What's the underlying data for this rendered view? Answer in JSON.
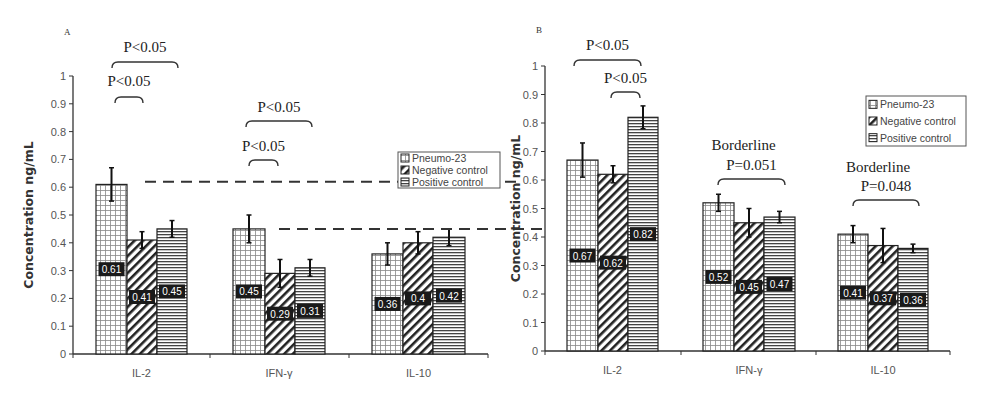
{
  "chart_data": [
    {
      "type": "bar",
      "panel": "A",
      "title": "",
      "xlabel": "",
      "ylabel": "Concentration ng/mL",
      "ylim": [
        0,
        1
      ],
      "yticks": [
        "0",
        "0.1",
        "0.2",
        "0.3",
        "0.4",
        "0.5",
        "0.6",
        "0.7",
        "0.8",
        "0.9",
        "1"
      ],
      "grid": false,
      "categories": [
        "IL-2",
        "IFN-γ",
        "IL-10"
      ],
      "series": [
        {
          "name": "Pneumo-23",
          "pattern": "grid",
          "values": [
            0.61,
            0.45,
            0.36
          ],
          "errors": [
            0.06,
            0.05,
            0.04
          ],
          "labels": [
            "0.61",
            "0.45",
            "0.36"
          ]
        },
        {
          "name": "Negative control",
          "pattern": "diagonal",
          "values": [
            0.41,
            0.29,
            0.4
          ],
          "errors": [
            0.03,
            0.05,
            0.04
          ],
          "labels": [
            "0.41",
            "0.29",
            "0.4"
          ]
        },
        {
          "name": "Positive control",
          "pattern": "horizontal",
          "values": [
            0.45,
            0.31,
            0.42
          ],
          "errors": [
            0.03,
            0.03,
            0.03
          ],
          "labels": [
            "0.45",
            "0.31",
            "0.42"
          ]
        }
      ],
      "legend": {
        "placement": "right",
        "entries": [
          "Pneumo-23",
          "Negative control",
          "Positive control"
        ]
      },
      "annotations": [
        {
          "text": "P<0.05",
          "category": 0,
          "from": 0,
          "to": 2,
          "level": "high"
        },
        {
          "text": "P<0.05",
          "category": 0,
          "from": 0,
          "to": 1,
          "level": "low"
        },
        {
          "text": "P<0.05",
          "category": 1,
          "from": 0,
          "to": 2,
          "level": "high"
        },
        {
          "text": "P<0.05",
          "category": 1,
          "from": 0,
          "to": 1,
          "level": "low"
        }
      ],
      "reference_lines": [
        0.62,
        0.45
      ]
    },
    {
      "type": "bar",
      "panel": "B",
      "title": "",
      "xlabel": "",
      "ylabel": "Concentration ng/mL",
      "ylim": [
        0,
        1
      ],
      "yticks": [
        "0",
        "0.1",
        "0.2",
        "0.3",
        "0.4",
        "0.5",
        "0.6",
        "0.7",
        "0.8",
        "0.9",
        "1"
      ],
      "grid": false,
      "categories": [
        "IL-2",
        "IFN-γ",
        "IL-10"
      ],
      "series": [
        {
          "name": "Pneumo-23",
          "pattern": "grid",
          "values": [
            0.67,
            0.52,
            0.41
          ],
          "errors": [
            0.06,
            0.03,
            0.03
          ],
          "labels": [
            "0.67",
            "0.52",
            "0.41"
          ]
        },
        {
          "name": "Negative control",
          "pattern": "diagonal",
          "values": [
            0.62,
            0.45,
            0.37
          ],
          "errors": [
            0.03,
            0.05,
            0.06
          ],
          "labels": [
            "0.62",
            "0.45",
            "0.37"
          ]
        },
        {
          "name": "Positive control",
          "pattern": "horizontal",
          "values": [
            0.82,
            0.47,
            0.36
          ],
          "errors": [
            0.04,
            0.02,
            0.015
          ],
          "labels": [
            "0.82",
            "0.47",
            "0.36"
          ]
        }
      ],
      "legend": {
        "placement": "top-right",
        "entries": [
          "Pneumo-23",
          "Negative control",
          "Positive control"
        ]
      },
      "annotations": [
        {
          "text": "P<0.05",
          "category": 0,
          "from": 0,
          "to": 2,
          "level": "high"
        },
        {
          "text": "P<0.05",
          "category": 0,
          "from": 1,
          "to": 2,
          "level": "low"
        },
        {
          "text": "Borderline",
          "text2": "P=0.051",
          "category": 1,
          "from": 0,
          "to": 2
        },
        {
          "text": "Borderline",
          "text2": "P=0.048",
          "category": 2,
          "from": 0,
          "to": 2
        }
      ]
    }
  ]
}
